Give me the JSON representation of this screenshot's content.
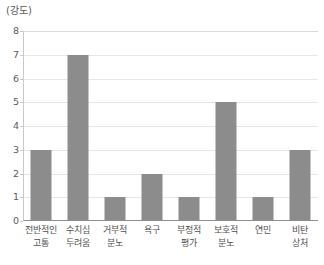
{
  "chart_data": {
    "type": "bar",
    "title": "",
    "subtitle": "",
    "xlabel": "",
    "ylabel": "(강도)",
    "ylim": [
      0,
      8
    ],
    "yticks": [
      "0",
      "1",
      "2",
      "3",
      "4",
      "5",
      "6",
      "7",
      "8"
    ],
    "grid": true,
    "legend": false,
    "orientation": "vertical",
    "bar_color": "#8c8c8c",
    "categories": [
      "전반적인 고통",
      "수치심 두려움",
      "거부적 분노",
      "욕구",
      "부정적 평가",
      "보호적 분노",
      "연민",
      "비탄 상처"
    ],
    "category_lines": [
      [
        "전반적인",
        "고통"
      ],
      [
        "수치심",
        "두려움"
      ],
      [
        "거부적",
        "분노"
      ],
      [
        "욕구",
        ""
      ],
      [
        "부정적",
        "평가"
      ],
      [
        "보호적",
        "분노"
      ],
      [
        "연민",
        ""
      ],
      [
        "비탄",
        "상처"
      ]
    ],
    "values": [
      3,
      7,
      1,
      2,
      1,
      5,
      1,
      3
    ],
    "series": [
      {
        "name": "강도",
        "values": [
          3,
          7,
          1,
          2,
          1,
          5,
          1,
          3
        ]
      }
    ]
  }
}
